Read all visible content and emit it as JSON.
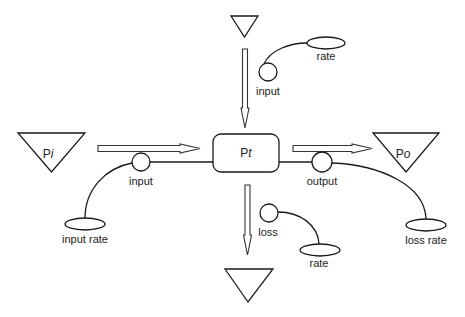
{
  "diagram": {
    "type": "stock-and-flow",
    "stock": {
      "id": "Pt",
      "label_main": "P",
      "label_sub": "t"
    },
    "sources": [
      {
        "id": "Pi",
        "label_main": "P",
        "label_sub": "i",
        "role": "source"
      },
      {
        "id": "Po",
        "label_main": "P",
        "label_sub": "o",
        "role": "sink"
      },
      {
        "id": "top-cloud",
        "label_main": "",
        "label_sub": "",
        "role": "source"
      },
      {
        "id": "bottom-cloud",
        "label_main": "",
        "label_sub": "",
        "role": "sink"
      }
    ],
    "flows": [
      {
        "id": "input-left",
        "label": "input",
        "from": "Pi",
        "to": "Pt"
      },
      {
        "id": "input-top",
        "label": "input",
        "from": "top-cloud",
        "to": "Pt"
      },
      {
        "id": "output",
        "label": "output",
        "from": "Pt",
        "to": "Po"
      },
      {
        "id": "loss",
        "label": "loss",
        "from": "Pt",
        "to": "bottom-cloud"
      }
    ],
    "converters": [
      {
        "id": "rate-top",
        "label": "rate",
        "controls": "input-top"
      },
      {
        "id": "input-rate",
        "label": "input rate",
        "controls": "input-left"
      },
      {
        "id": "loss-rate",
        "label": "loss rate",
        "controls": "output"
      },
      {
        "id": "rate-bottom",
        "label": "rate",
        "controls": "loss"
      }
    ]
  }
}
